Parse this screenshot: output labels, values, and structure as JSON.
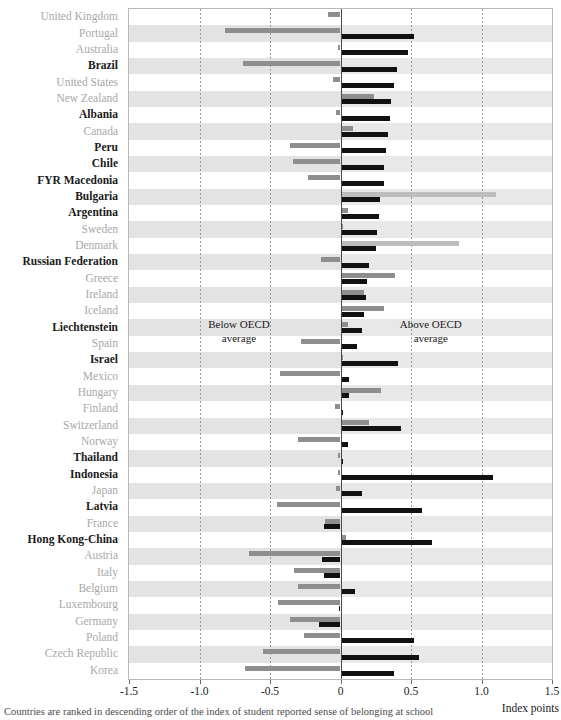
{
  "chart_data": {
    "type": "bar",
    "orientation": "horizontal",
    "title": "",
    "xlabel": "Index points",
    "ylabel": "",
    "xlim": [
      -1.5,
      1.5
    ],
    "xticks": [
      -1.5,
      -1.0,
      -0.5,
      0,
      0.5,
      1.0,
      1.5
    ],
    "xticklabels": [
      "-1.5",
      "-1.0",
      "-0.5",
      "0",
      "0.5",
      "1.0",
      "1.5"
    ],
    "grid": true,
    "zero_reference": 0,
    "legend_position": "none",
    "annotations": [
      {
        "text_line1": "Below OECD",
        "text_line2": "average",
        "x": -0.72,
        "y_row": 19
      },
      {
        "text_line1": "Above OECD",
        "text_line2": "average",
        "x": 0.64,
        "y_row": 19
      }
    ],
    "series": [
      {
        "name": "series-grey",
        "color": "#8e8e8e"
      },
      {
        "name": "series-black",
        "color": "#111111"
      }
    ],
    "categories": [
      "United Kingdom",
      "Portugal",
      "Australia",
      "Brazil",
      "United States",
      "New Zealand",
      "Albania",
      "Canada",
      "Peru",
      "Chile",
      "FYR Macedonia",
      "Bulgaria",
      "Argentina",
      "Sweden",
      "Denmark",
      "Russian Federation",
      "Greece",
      "Ireland",
      "Iceland",
      "Liechtenstein",
      "Spain",
      "Israel",
      "Mexico",
      "Hungary",
      "Finland",
      "Switzerland",
      "Norway",
      "Thailand",
      "Indonesia",
      "Japan",
      "Latvia",
      "France",
      "Hong Kong-China",
      "Austria",
      "Italy",
      "Belgium",
      "Luxembourg",
      "Germany",
      "Poland",
      "Czech Republic",
      "Korea"
    ],
    "highlighted": [
      "Brazil",
      "Albania",
      "Peru",
      "Chile",
      "FYR Macedonia",
      "Bulgaria",
      "Argentina",
      "Russian Federation",
      "Liechtenstein",
      "Israel",
      "Thailand",
      "Indonesia",
      "Latvia",
      "Hong Kong-China"
    ],
    "rows": [
      {
        "category": "United Kingdom",
        "grey": -0.09,
        "black": 0.01
      },
      {
        "category": "Portugal",
        "grey": -0.82,
        "black": 0.52
      },
      {
        "category": "Australia",
        "grey": -0.02,
        "black": 0.48
      },
      {
        "category": "Brazil",
        "grey": -0.69,
        "black": 0.4
      },
      {
        "category": "United States",
        "grey": -0.05,
        "black": 0.38
      },
      {
        "category": "New Zealand",
        "grey": 0.24,
        "black": 0.36
      },
      {
        "category": "Albania",
        "grey": -0.03,
        "black": 0.35
      },
      {
        "category": "Canada",
        "grey": 0.09,
        "black": 0.34
      },
      {
        "category": "Peru",
        "grey": -0.36,
        "black": 0.32
      },
      {
        "category": "Chile",
        "grey": -0.34,
        "black": 0.31
      },
      {
        "category": "FYR Macedonia",
        "grey": -0.23,
        "black": 0.31
      },
      {
        "category": "Bulgaria",
        "grey": 1.1,
        "black": 0.28
      },
      {
        "category": "Argentina",
        "grey": 0.05,
        "black": 0.27
      },
      {
        "category": "Sweden",
        "grey": 0.02,
        "black": 0.26
      },
      {
        "category": "Denmark",
        "grey": 0.84,
        "black": 0.25
      },
      {
        "category": "Russian Federation",
        "grey": -0.14,
        "black": 0.2
      },
      {
        "category": "Greece",
        "grey": 0.39,
        "black": 0.19
      },
      {
        "category": "Ireland",
        "grey": 0.17,
        "black": 0.18
      },
      {
        "category": "Iceland",
        "grey": 0.31,
        "black": 0.17
      },
      {
        "category": "Liechtenstein",
        "grey": 0.05,
        "black": 0.15
      },
      {
        "category": "Spain",
        "grey": -0.28,
        "black": 0.12
      },
      {
        "category": "Israel",
        "grey": 0.02,
        "black": 0.41
      },
      {
        "category": "Mexico",
        "grey": -0.43,
        "black": 0.06
      },
      {
        "category": "Hungary",
        "grey": 0.29,
        "black": 0.06
      },
      {
        "category": "Finland",
        "grey": -0.04,
        "black": 0.02
      },
      {
        "category": "Switzerland",
        "grey": 0.2,
        "black": 0.43
      },
      {
        "category": "Norway",
        "grey": -0.3,
        "black": 0.05
      },
      {
        "category": "Thailand",
        "grey": -0.02,
        "black": 0.02
      },
      {
        "category": "Indonesia",
        "grey": -0.02,
        "black": 1.08
      },
      {
        "category": "Japan",
        "grey": -0.03,
        "black": 0.15
      },
      {
        "category": "Latvia",
        "grey": -0.45,
        "black": 0.58
      },
      {
        "category": "France",
        "grey": -0.11,
        "black": -0.12
      },
      {
        "category": "Hong Kong-China",
        "grey": 0.04,
        "black": 0.65
      },
      {
        "category": "Austria",
        "grey": -0.65,
        "black": -0.13
      },
      {
        "category": "Italy",
        "grey": -0.33,
        "black": -0.12
      },
      {
        "category": "Belgium",
        "grey": -0.3,
        "black": 0.1
      },
      {
        "category": "Luxembourg",
        "grey": -0.44,
        "black": -0.01
      },
      {
        "category": "Germany",
        "grey": -0.36,
        "black": -0.15
      },
      {
        "category": "Poland",
        "grey": -0.26,
        "black": 0.52
      },
      {
        "category": "Czech Republic",
        "grey": -0.55,
        "black": 0.56
      },
      {
        "category": "Korea",
        "grey": -0.68,
        "black": 0.38
      }
    ]
  },
  "axis": {
    "unit_label": "Index points"
  },
  "footer": {
    "caption": "Countries are ranked in descending order of the index of student reported sense of belonging at school"
  },
  "colors": {
    "grey_bar": "#8e8e8e",
    "black_bar": "#111111",
    "band": "#d2d2d2",
    "grid": "#9a9a9a",
    "highlight_text": "#1a1a1a",
    "dim_text": "#a8a8a8"
  }
}
